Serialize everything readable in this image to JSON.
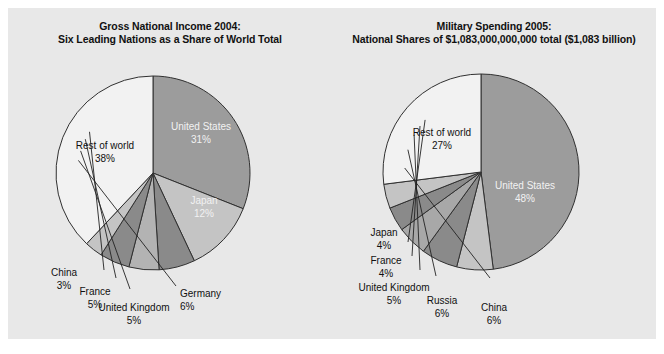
{
  "figure": {
    "background": "#ffffff",
    "panel_color": "#e8e8e8",
    "outline_color": "#333333"
  },
  "charts": [
    {
      "id": "gross-national-income-2004",
      "title_line1": "Gross National Income 2004:",
      "title_line2": "Six Leading Nations as a Share of World Total",
      "slices": [
        {
          "label": "United States",
          "value": 31,
          "value_text": "31%",
          "color": "#9c9c9c",
          "label_position": "inside"
        },
        {
          "label": "Japan",
          "value": 12,
          "value_text": "12%",
          "color": "#c4c4c4",
          "label_position": "inside"
        },
        {
          "label": "Germany",
          "value": 6,
          "value_text": "6%",
          "color": "#8a8a8a",
          "label_position": "outside"
        },
        {
          "label": "United Kingdom",
          "value": 5,
          "value_text": "5%",
          "color": "#b3b3b3",
          "label_position": "outside"
        },
        {
          "label": "France",
          "value": 5,
          "value_text": "5%",
          "color": "#8a8a8a",
          "label_position": "outside"
        },
        {
          "label": "China",
          "value": 3,
          "value_text": "3%",
          "color": "#c4c4c4",
          "label_position": "outside"
        },
        {
          "label": "Rest of world",
          "value": 38,
          "value_text": "38%",
          "color": "#f2f2f2",
          "label_position": "inside"
        }
      ]
    },
    {
      "id": "military-spending-2005",
      "title_line1": "Military Spending 2005:",
      "title_line2": "National Shares of $1,083,000,000,000 total ($1,083 billion)",
      "slices": [
        {
          "label": "United States",
          "value": 48,
          "value_text": "48%",
          "color": "#9c9c9c",
          "label_position": "inside"
        },
        {
          "label": "China",
          "value": 6,
          "value_text": "6%",
          "color": "#c4c4c4",
          "label_position": "outside"
        },
        {
          "label": "Russia",
          "value": 6,
          "value_text": "6%",
          "color": "#8a8a8a",
          "label_position": "outside"
        },
        {
          "label": "United Kingdom",
          "value": 5,
          "value_text": "5%",
          "color": "#a8a8a8",
          "label_position": "outside"
        },
        {
          "label": "France",
          "value": 4,
          "value_text": "4%",
          "color": "#8a8a8a",
          "label_position": "outside"
        },
        {
          "label": "Japan",
          "value": 4,
          "value_text": "4%",
          "color": "#c4c4c4",
          "label_position": "outside"
        },
        {
          "label": "Rest of world",
          "value": 27,
          "value_text": "27%",
          "color": "#f2f2f2",
          "label_position": "inside"
        }
      ]
    }
  ],
  "chart_data": [
    {
      "type": "pie",
      "title": "Gross National Income 2004: Six Leading Nations as a Share of World Total",
      "categories": [
        "United States",
        "Japan",
        "Germany",
        "United Kingdom",
        "France",
        "China",
        "Rest of world"
      ],
      "values": [
        31,
        12,
        6,
        5,
        5,
        3,
        38
      ],
      "unit": "percent of world total",
      "start_angle_deg": 0,
      "direction": "clockwise",
      "legend": "none-labels-on-slices"
    },
    {
      "type": "pie",
      "title": "Military Spending 2005: National Shares of $1,083,000,000,000 total ($1,083 billion)",
      "categories": [
        "United States",
        "China",
        "Russia",
        "United Kingdom",
        "France",
        "Japan",
        "Rest of world"
      ],
      "values": [
        48,
        6,
        6,
        5,
        4,
        4,
        27
      ],
      "unit": "percent of $1,083 billion world total",
      "start_angle_deg": 0,
      "direction": "clockwise",
      "legend": "none-labels-on-slices"
    }
  ]
}
